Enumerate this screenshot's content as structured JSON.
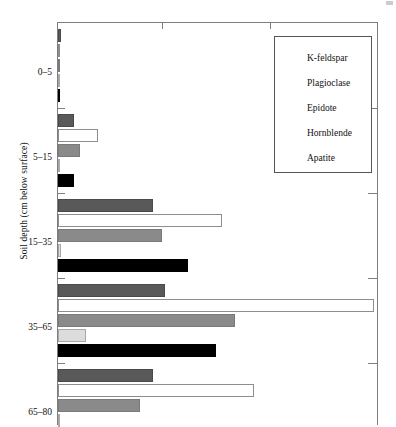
{
  "chart_data": {
    "type": "bar",
    "orientation": "horizontal",
    "title": "",
    "xlabel": "",
    "ylabel": "Soil depth (cm below surface)",
    "categories": [
      "0–5",
      "5–15",
      "15–35",
      "35–65",
      "65–80"
    ],
    "xlim": [
      0,
      100
    ],
    "grid": false,
    "legend_position": "top-right",
    "series": [
      {
        "name": "K-feldspar",
        "color": "#595959",
        "values": [
          1,
          5,
          30,
          34,
          30
        ]
      },
      {
        "name": "Plagioclase",
        "color": "#ffffff",
        "values": [
          0,
          12.5,
          52,
          100,
          62
        ]
      },
      {
        "name": "Epidote",
        "color": "#8a8a8a",
        "values": [
          0,
          7,
          33,
          56,
          26
        ]
      },
      {
        "name": "Hornblende",
        "color": "#dcdcdc",
        "values": [
          0,
          0.5,
          1,
          9,
          0
        ]
      },
      {
        "name": "Apatite",
        "color": "#000000",
        "values": [
          0,
          5,
          41,
          50,
          0
        ]
      }
    ]
  },
  "axis": {
    "y_title": "Soil depth (cm below surface)",
    "group_labels": [
      "0–5",
      "5–15",
      "15–35",
      "35–65",
      "65–80"
    ]
  },
  "legend": {
    "items": [
      {
        "label": "K-feldspar",
        "swatch": "kfeldspar"
      },
      {
        "label": "Plagioclase",
        "swatch": "plagioclase"
      },
      {
        "label": "Epidote",
        "swatch": "epidote"
      },
      {
        "label": "Hornblende",
        "swatch": "hornblende"
      },
      {
        "label": "Apatite",
        "swatch": "apatite"
      }
    ]
  }
}
